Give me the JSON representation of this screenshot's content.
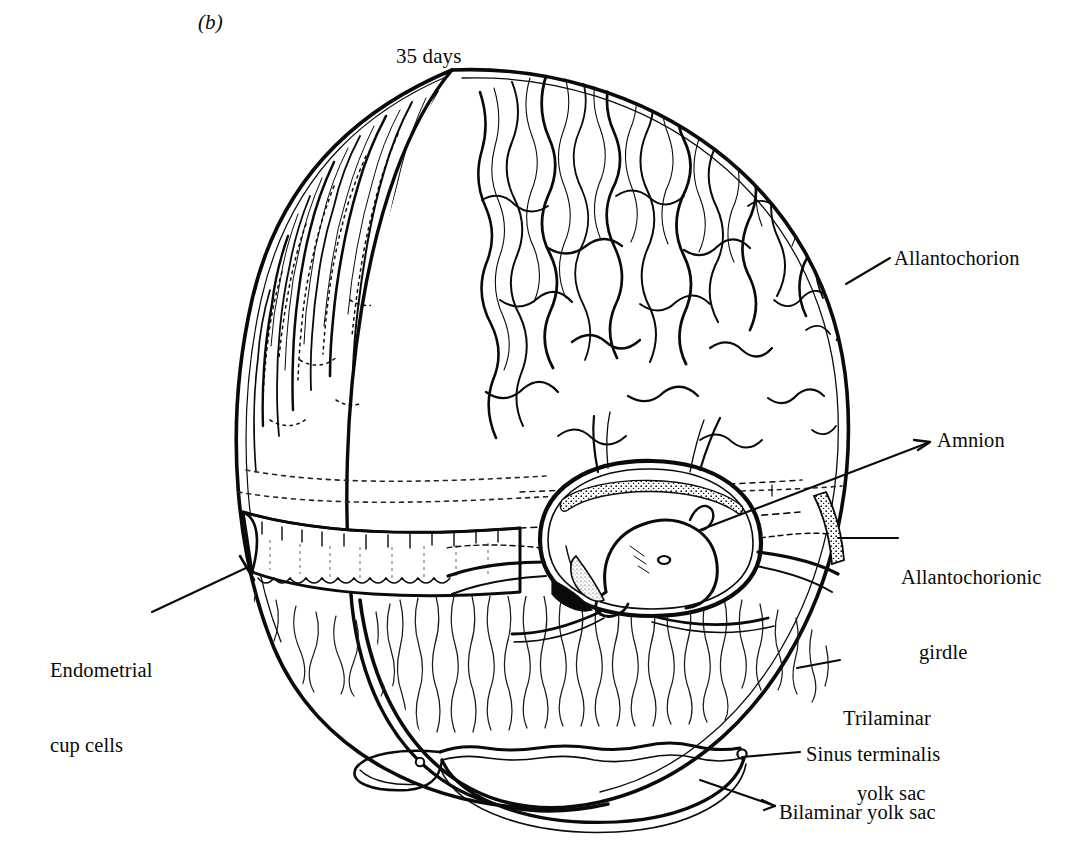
{
  "figure": {
    "panel_letter": "(b)",
    "stage_label": "35 days",
    "background_color": "#fffffe",
    "ink_color": "#0a0a0a"
  },
  "labels": [
    {
      "id": "allantochorion",
      "text": "Allantochorion",
      "position": "right-upper",
      "leader": "line",
      "lines": [
        "Allantochorion"
      ]
    },
    {
      "id": "amnion",
      "text": "Amnion",
      "position": "right-middle",
      "leader": "arrow",
      "lines": [
        "Amnion"
      ]
    },
    {
      "id": "allantochorionic-girdle",
      "text": "Allantochorionic girdle",
      "position": "right-middle-lower",
      "leader": "line",
      "lines": [
        "Allantochorionic",
        "girdle"
      ]
    },
    {
      "id": "endometrial-cup-cells",
      "text": "Endometrial cup cells",
      "position": "left-lower",
      "leader": "line",
      "lines": [
        "Endometrial",
        "cup cells"
      ]
    },
    {
      "id": "trilaminar-yolk-sac",
      "text": "Trilaminar yolk sac",
      "position": "right-lower",
      "leader": "line",
      "lines": [
        "Trilaminar",
        "yolk sac"
      ]
    },
    {
      "id": "sinus-terminalis",
      "text": "Sinus terminalis",
      "position": "right-bottom",
      "leader": "line",
      "lines": [
        "Sinus terminalis"
      ]
    },
    {
      "id": "bilaminar-yolk-sac",
      "text": "Bilaminar yolk sac",
      "position": "right-bottom",
      "leader": "line",
      "lines": [
        "Bilaminar yolk sac"
      ]
    }
  ],
  "label_text": {
    "allantochorion": "Allantochorion",
    "amnion": "Amnion",
    "girdle_line1": "Allantochorionic",
    "girdle_line2": "girdle",
    "endometrial_line1": "Endometrial",
    "endometrial_line2": "cup cells",
    "trilaminar_line1": "Trilaminar",
    "trilaminar_line2": "yolk sac",
    "sinus": "Sinus terminalis",
    "bilaminar": "Bilaminar yolk sac"
  }
}
